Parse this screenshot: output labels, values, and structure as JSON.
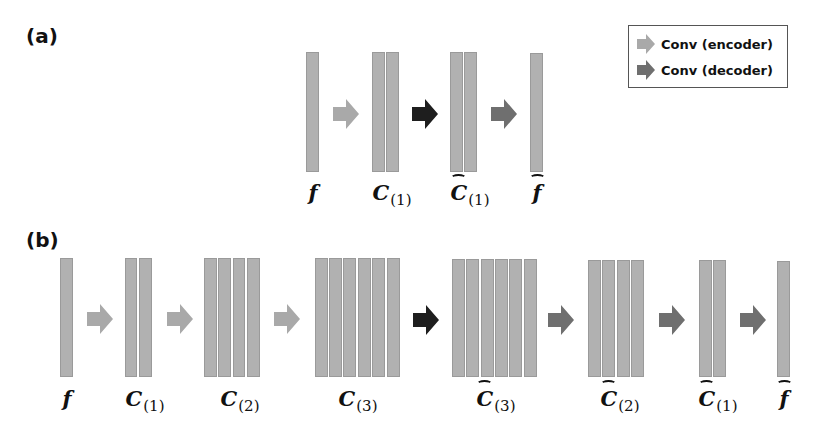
{
  "panels": {
    "a": {
      "label": "(a)",
      "nodes": [
        {
          "name": "f",
          "text": "f",
          "sub": "",
          "hat": false,
          "bars": 1
        },
        {
          "name": "C1",
          "text": "C",
          "sub": "(1)",
          "hat": false,
          "bars": 2
        },
        {
          "name": "C1hat",
          "text": "C",
          "sub": "(1)",
          "hat": true,
          "bars": 2
        },
        {
          "name": "fhat",
          "text": "f",
          "sub": "",
          "hat": true,
          "bars": 1
        }
      ],
      "arrows": [
        "encoder",
        "bottleneck",
        "decoder"
      ]
    },
    "b": {
      "label": "(b)",
      "nodes": [
        {
          "name": "f",
          "text": "f",
          "sub": "",
          "hat": false,
          "bars": 1
        },
        {
          "name": "C1",
          "text": "C",
          "sub": "(1)",
          "hat": false,
          "bars": 2
        },
        {
          "name": "C2",
          "text": "C",
          "sub": "(2)",
          "hat": false,
          "bars": 4
        },
        {
          "name": "C3",
          "text": "C",
          "sub": "(3)",
          "hat": false,
          "bars": 6
        },
        {
          "name": "C3hat",
          "text": "C",
          "sub": "(3)",
          "hat": true,
          "bars": 6
        },
        {
          "name": "C2hat",
          "text": "C",
          "sub": "(2)",
          "hat": true,
          "bars": 4
        },
        {
          "name": "C1hat",
          "text": "C",
          "sub": "(1)",
          "hat": true,
          "bars": 2
        },
        {
          "name": "fhat",
          "text": "f",
          "sub": "",
          "hat": true,
          "bars": 1
        }
      ],
      "arrows": [
        "encoder",
        "encoder",
        "encoder",
        "bottleneck",
        "decoder",
        "decoder",
        "decoder"
      ]
    }
  },
  "legend": {
    "items": [
      {
        "label": "Conv (encoder)",
        "color": "#a9a9a9"
      },
      {
        "label": "Conv (decoder)",
        "color": "#6f6f6f"
      }
    ]
  },
  "colors": {
    "encoder": "#a9a9a9",
    "decoder": "#6f6f6f",
    "bottleneck": "#1e1e1e",
    "bar_fill": "#b1b1b1",
    "bar_border": "#9a9a9a"
  }
}
